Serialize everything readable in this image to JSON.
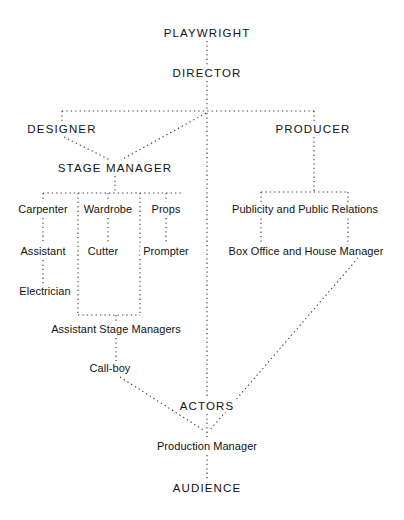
{
  "diagram": {
    "style": {
      "background": "#ffffff",
      "line_color": "#3a3a3a",
      "text_color": "#131313",
      "line_style": "dotted"
    },
    "nodes": [
      {
        "id": "playwright",
        "label": "PLAYWRIGHT",
        "x": 207,
        "y": 33,
        "case": "caps",
        "emphasis": "wide"
      },
      {
        "id": "director",
        "label": "DIRECTOR",
        "x": 207,
        "y": 73,
        "case": "caps",
        "emphasis": "wide"
      },
      {
        "id": "designer",
        "label": "DESIGNER",
        "x": 62,
        "y": 129,
        "case": "caps",
        "emphasis": "wide"
      },
      {
        "id": "producer",
        "label": "PRODUCER",
        "x": 313,
        "y": 129,
        "case": "caps",
        "emphasis": "wide"
      },
      {
        "id": "stage-manager",
        "label": "STAGE  MANAGER",
        "x": 115,
        "y": 168,
        "case": "caps",
        "emphasis": "wide"
      },
      {
        "id": "carpenter",
        "label": "Carpenter",
        "x": 43,
        "y": 210,
        "case": "mixed",
        "emphasis": "none"
      },
      {
        "id": "wardrobe",
        "label": "Wardrobe",
        "x": 108,
        "y": 210,
        "case": "mixed",
        "emphasis": "none"
      },
      {
        "id": "props",
        "label": "Props",
        "x": 166,
        "y": 210,
        "case": "mixed",
        "emphasis": "none"
      },
      {
        "id": "publicity",
        "label": "Publicity and Public Relations",
        "x": 305,
        "y": 210,
        "case": "mixed",
        "emphasis": "none"
      },
      {
        "id": "assistant",
        "label": "Assistant",
        "x": 43,
        "y": 252,
        "case": "mixed",
        "emphasis": "none"
      },
      {
        "id": "cutter",
        "label": "Cutter",
        "x": 103,
        "y": 252,
        "case": "mixed",
        "emphasis": "none"
      },
      {
        "id": "prompter",
        "label": "Prompter",
        "x": 166,
        "y": 252,
        "case": "mixed",
        "emphasis": "none"
      },
      {
        "id": "box-office",
        "label": "Box Office and House Manager",
        "x": 306,
        "y": 252,
        "case": "mixed",
        "emphasis": "none"
      },
      {
        "id": "electrician",
        "label": "Electrician",
        "x": 45,
        "y": 292,
        "case": "mixed",
        "emphasis": "none"
      },
      {
        "id": "asm",
        "label": "Assistant Stage Managers",
        "x": 116,
        "y": 330,
        "case": "mixed",
        "emphasis": "none"
      },
      {
        "id": "call-boy",
        "label": "Call-boy",
        "x": 110,
        "y": 369,
        "case": "mixed",
        "emphasis": "none"
      },
      {
        "id": "actors",
        "label": "ACTORS",
        "x": 207,
        "y": 406,
        "case": "caps",
        "emphasis": "wide"
      },
      {
        "id": "prod-manager",
        "label": "Production Manager",
        "x": 207,
        "y": 447,
        "case": "mixed",
        "emphasis": "none"
      },
      {
        "id": "audience",
        "label": "AUDIENCE",
        "x": 207,
        "y": 488,
        "case": "caps",
        "emphasis": "wide"
      }
    ],
    "connections": [
      {
        "id": "playwright-director",
        "from": "playwright",
        "to": "director",
        "kind": "vertical"
      },
      {
        "id": "director-spine-top",
        "from": "director",
        "to": "crossbar",
        "kind": "vertical"
      },
      {
        "id": "top-crossbar",
        "from": "designer",
        "to": "producer",
        "kind": "horizontal"
      },
      {
        "id": "designer-stub",
        "from": "crossbar",
        "to": "designer",
        "kind": "vertical"
      },
      {
        "id": "designer-stage-manager",
        "from": "designer",
        "to": "stage-manager",
        "kind": "diagonal"
      },
      {
        "id": "director-stage-manager",
        "from": "director",
        "to": "stage-manager",
        "kind": "diagonal"
      },
      {
        "id": "producer-stub",
        "from": "crossbar",
        "to": "producer",
        "kind": "vertical"
      },
      {
        "id": "producer-to-bar",
        "from": "producer",
        "to": "right-bar",
        "kind": "vertical"
      },
      {
        "id": "right-crossbar",
        "from": "publicity",
        "to": "box-office",
        "kind": "horizontal"
      },
      {
        "id": "publicity-branch",
        "from": "right-bar",
        "to": "publicity",
        "kind": "vertical"
      },
      {
        "id": "box-office-branch",
        "from": "right-bar",
        "to": "box-office",
        "kind": "vertical"
      },
      {
        "id": "box-office-prod-manager",
        "from": "box-office",
        "to": "prod-manager",
        "kind": "diagonal"
      },
      {
        "id": "stage-manager-to-bar",
        "from": "stage-manager",
        "to": "left-bar",
        "kind": "vertical"
      },
      {
        "id": "left-crossbar",
        "from": "carpenter",
        "to": "props",
        "kind": "horizontal"
      },
      {
        "id": "carpenter-column",
        "from": "carpenter",
        "to": "electrician",
        "kind": "vertical"
      },
      {
        "id": "wardrobe-column",
        "from": "wardrobe",
        "to": "cutter",
        "kind": "vertical"
      },
      {
        "id": "props-column",
        "from": "props",
        "to": "prompter",
        "kind": "vertical"
      },
      {
        "id": "asm-crossbar",
        "from": "wardrobe",
        "to": "props",
        "kind": "horizontal"
      },
      {
        "id": "asm-stub",
        "from": "asm-bar",
        "to": "asm",
        "kind": "vertical"
      },
      {
        "id": "asm-call-boy",
        "from": "asm",
        "to": "call-boy",
        "kind": "vertical"
      },
      {
        "id": "call-boy-prod-manager",
        "from": "call-boy",
        "to": "prod-manager",
        "kind": "diagonal"
      },
      {
        "id": "director-spine-actors",
        "from": "crossbar",
        "to": "actors",
        "kind": "vertical"
      },
      {
        "id": "actors-prod-manager",
        "from": "actors",
        "to": "prod-manager",
        "kind": "vertical"
      },
      {
        "id": "prod-manager-audience",
        "from": "prod-manager",
        "to": "audience",
        "kind": "vertical"
      }
    ]
  }
}
